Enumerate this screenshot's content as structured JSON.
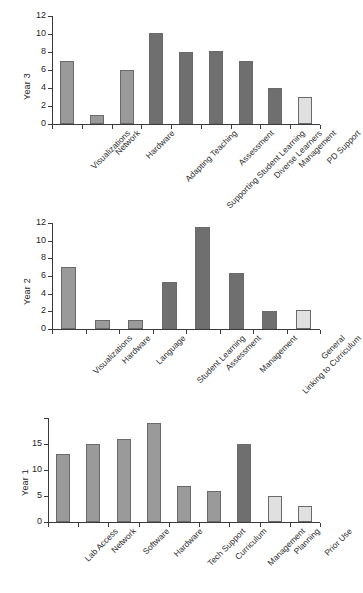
{
  "figure": {
    "title": "",
    "panel_count": 3,
    "colors": {
      "bar_medium": "#9a9a9a",
      "bar_dark": "#6f6f6f",
      "bar_light": "#e0e0e0",
      "bar_border": "#6a6a6a",
      "axis": "#3a3a3a",
      "text": "#262626",
      "background": "#ffffff"
    }
  },
  "chart_data": [
    {
      "type": "bar",
      "title": "",
      "ylabel": "Year 3",
      "xlabel": "",
      "ylim": [
        0,
        12
      ],
      "yticks": [
        0,
        2,
        4,
        6,
        8,
        10,
        12
      ],
      "ytick_labels": [
        "0",
        "2",
        "4",
        "6",
        "8",
        "10",
        "12"
      ],
      "grid": false,
      "legend": "none",
      "categories": [
        "Visualizations",
        "Network",
        "Hardware",
        "Adapting Teaching",
        "Supporting Student Learning",
        "Assessment",
        "Diverse Learners",
        "Management",
        "PD Support"
      ],
      "values": [
        7,
        1,
        6,
        10.1,
        8,
        8.1,
        7,
        4,
        3
      ],
      "bar_colors": [
        "#9a9a9a",
        "#9a9a9a",
        "#9a9a9a",
        "#6f6f6f",
        "#6f6f6f",
        "#6f6f6f",
        "#6f6f6f",
        "#6f6f6f",
        "#e0e0e0"
      ]
    },
    {
      "type": "bar",
      "title": "",
      "ylabel": "Year 2",
      "xlabel": "",
      "ylim": [
        0,
        12
      ],
      "yticks": [
        0,
        2,
        4,
        6,
        8,
        10,
        12
      ],
      "ytick_labels": [
        "0",
        "2",
        "4",
        "6",
        "8",
        "10",
        "12"
      ],
      "grid": false,
      "legend": "none",
      "categories": [
        "Visualizations",
        "Hardware",
        "Language",
        "Student Learning",
        "Assessment",
        "Management",
        "Linking to Curriculum",
        "General"
      ],
      "values": [
        7,
        1,
        1,
        5.3,
        11.5,
        6.3,
        2,
        2.1
      ],
      "bar_colors": [
        "#9a9a9a",
        "#9a9a9a",
        "#9a9a9a",
        "#6f6f6f",
        "#6f6f6f",
        "#6f6f6f",
        "#6f6f6f",
        "#e0e0e0"
      ]
    },
    {
      "type": "bar",
      "title": "",
      "ylabel": "Year 1",
      "xlabel": "",
      "ylim": [
        0,
        20
      ],
      "yticks": [
        0,
        5,
        10,
        15,
        20
      ],
      "ytick_labels": [
        "0",
        "5",
        "10",
        "15",
        ""
      ],
      "grid": false,
      "legend": "none",
      "categories": [
        "Lab Access",
        "Network",
        "Software",
        "Hardware",
        "Tech Support",
        "Curriculum",
        "Management",
        "Planning",
        "Prior Use"
      ],
      "values": [
        13,
        15,
        16,
        19,
        7,
        6,
        15,
        5,
        3
      ],
      "bar_colors": [
        "#9a9a9a",
        "#9a9a9a",
        "#9a9a9a",
        "#9a9a9a",
        "#9a9a9a",
        "#9a9a9a",
        "#6f6f6f",
        "#e0e0e0",
        "#e0e0e0"
      ]
    }
  ]
}
